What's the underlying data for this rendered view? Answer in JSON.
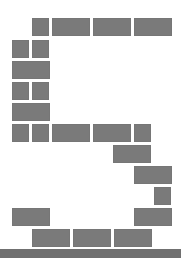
{
  "figure": {
    "glyph": "5",
    "brick_color": "#7a7a7a",
    "ground_color": "#707070",
    "background_color": "#ffffff",
    "bricks": [
      {
        "x": 32,
        "y": 18,
        "w": 17,
        "h": 18
      },
      {
        "x": 52,
        "y": 18,
        "w": 38,
        "h": 18
      },
      {
        "x": 93,
        "y": 18,
        "w": 38,
        "h": 18
      },
      {
        "x": 134,
        "y": 18,
        "w": 38,
        "h": 18
      },
      {
        "x": 12,
        "y": 40,
        "w": 17,
        "h": 18
      },
      {
        "x": 32,
        "y": 40,
        "w": 17,
        "h": 18
      },
      {
        "x": 12,
        "y": 61,
        "w": 38,
        "h": 18
      },
      {
        "x": 12,
        "y": 82,
        "w": 17,
        "h": 18
      },
      {
        "x": 32,
        "y": 82,
        "w": 17,
        "h": 18
      },
      {
        "x": 12,
        "y": 103,
        "w": 38,
        "h": 18
      },
      {
        "x": 12,
        "y": 124,
        "w": 17,
        "h": 18
      },
      {
        "x": 32,
        "y": 124,
        "w": 17,
        "h": 18
      },
      {
        "x": 52,
        "y": 124,
        "w": 38,
        "h": 18
      },
      {
        "x": 93,
        "y": 124,
        "w": 38,
        "h": 18
      },
      {
        "x": 134,
        "y": 124,
        "w": 17,
        "h": 18
      },
      {
        "x": 113,
        "y": 145,
        "w": 38,
        "h": 18
      },
      {
        "x": 134,
        "y": 166,
        "w": 38,
        "h": 18
      },
      {
        "x": 154,
        "y": 187,
        "w": 17,
        "h": 18
      },
      {
        "x": 12,
        "y": 208,
        "w": 38,
        "h": 18
      },
      {
        "x": 134,
        "y": 208,
        "w": 38,
        "h": 18
      },
      {
        "x": 32,
        "y": 229,
        "w": 38,
        "h": 18
      },
      {
        "x": 73,
        "y": 229,
        "w": 38,
        "h": 18
      },
      {
        "x": 114,
        "y": 229,
        "w": 38,
        "h": 18
      }
    ]
  }
}
